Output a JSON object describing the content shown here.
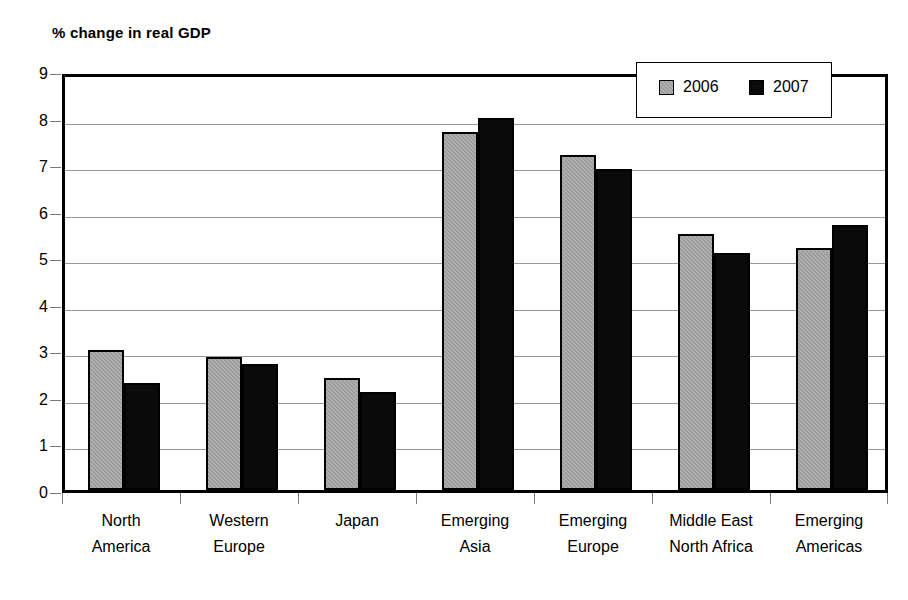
{
  "chart_data": {
    "type": "bar",
    "title": "% change in real GDP",
    "xlabel": "",
    "ylabel": "",
    "ylim": [
      0,
      9
    ],
    "yticks": [
      0,
      1,
      2,
      3,
      4,
      5,
      6,
      7,
      8,
      9
    ],
    "grid": true,
    "legend_position": "top-right",
    "categories": [
      "North America",
      "Western Europe",
      "Japan",
      "Emerging Asia",
      "Emerging Europe",
      "Middle East North Africa",
      "Emerging Americas"
    ],
    "category_lines": [
      [
        "North",
        "America"
      ],
      [
        "Western",
        "Europe"
      ],
      [
        "Japan",
        ""
      ],
      [
        "Emerging",
        "Asia"
      ],
      [
        "Emerging",
        "Europe"
      ],
      [
        "Middle East",
        "North Africa"
      ],
      [
        "Emerging",
        "Americas"
      ]
    ],
    "series": [
      {
        "name": "2006",
        "color": "#9c9c9c",
        "values": [
          3.0,
          2.85,
          2.4,
          7.7,
          7.2,
          5.5,
          5.2
        ]
      },
      {
        "name": "2007",
        "color": "#0a0a0a",
        "values": [
          2.3,
          2.7,
          2.1,
          8.0,
          6.9,
          5.1,
          5.7
        ]
      }
    ]
  },
  "legend": {
    "entries": [
      {
        "label": "2006",
        "swatch": "gray-swatch-icon"
      },
      {
        "label": "2007",
        "swatch": "black-swatch-icon"
      }
    ]
  }
}
